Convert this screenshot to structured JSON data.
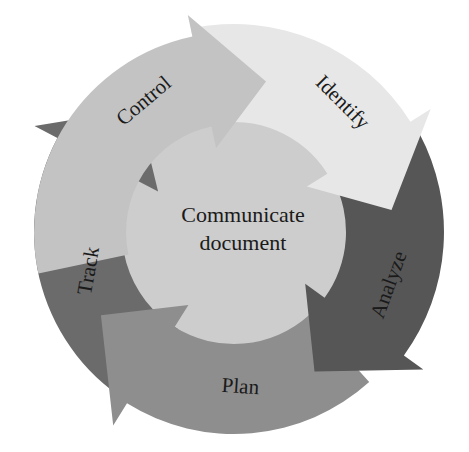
{
  "diagram": {
    "type": "cycle",
    "center": {
      "line1": "Communicate",
      "line2": "document",
      "color": "#cdcdcd"
    },
    "segments": [
      {
        "id": "control",
        "label": "Control",
        "color": "#c3c3c3"
      },
      {
        "id": "identify",
        "label": "Identify",
        "color": "#e7e7e7"
      },
      {
        "id": "analyze",
        "label": "Analyze",
        "color": "#565656"
      },
      {
        "id": "plan",
        "label": "Plan",
        "color": "#8e8e8e"
      },
      {
        "id": "track",
        "label": "Track",
        "color": "#6b6b6b"
      }
    ],
    "flow_direction": "clockwise"
  }
}
